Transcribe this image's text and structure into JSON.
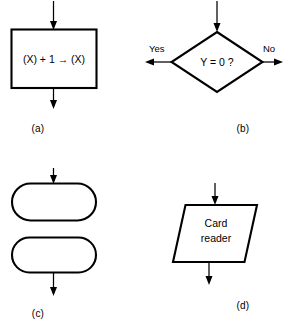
{
  "figure": {
    "background_color": "#ffffff",
    "line_color": "#000000"
  },
  "panels": [
    {
      "id": "a",
      "caption": "(a)",
      "symbol": "process-rectangle",
      "text": "(X) + 1 → (X)",
      "has_input_arrow": true,
      "has_output_arrow": true
    },
    {
      "id": "b",
      "caption": "(b)",
      "symbol": "decision-diamond",
      "text": "Y = 0 ?",
      "branch_left_label": "Yes",
      "branch_right_label": "No",
      "has_input_arrow": true
    },
    {
      "id": "c",
      "caption": "(c)",
      "symbol": "terminal-stadium-pair",
      "text_upper": "",
      "text_lower": "",
      "has_input_arrow": true,
      "has_output_arrow": true
    },
    {
      "id": "d",
      "caption": "(d)",
      "symbol": "input-output-parallelogram",
      "text_line1": "Card",
      "text_line2": "reader",
      "has_input_arrow": true,
      "has_output_arrow": true
    }
  ]
}
